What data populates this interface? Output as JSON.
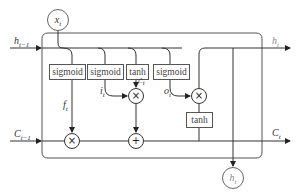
{
  "diagram": {
    "type": "LSTM cell",
    "inputs": {
      "x": {
        "base": "x",
        "sub": "t"
      },
      "h_prev": {
        "base": "h",
        "sub": "t−1"
      },
      "c_prev": {
        "base": "C",
        "sub": "t−1"
      }
    },
    "outputs": {
      "h_right": {
        "base": "h",
        "sub": "t"
      },
      "c_right": {
        "base": "C",
        "sub": "t"
      },
      "h_bottom": {
        "base": "h",
        "sub": "t"
      }
    },
    "gates": [
      {
        "id": "forget",
        "label": "sigmoid",
        "output": {
          "base": "f",
          "sub": "t"
        }
      },
      {
        "id": "input",
        "label": "sigmoid",
        "output": {
          "base": "i",
          "sub": "t"
        }
      },
      {
        "id": "candidate",
        "label": "tanh",
        "output": {
          "base": "C̃",
          "sub": "t"
        }
      },
      {
        "id": "output",
        "label": "sigmoid",
        "output": {
          "base": "o",
          "sub": "t"
        }
      }
    ],
    "cell_tanh": {
      "label": "tanh"
    },
    "operators": {
      "forget_mult": "×",
      "input_mult": "×",
      "cell_add": "+",
      "output_mult": "×"
    },
    "colors": {
      "line": "#333333",
      "box_border": "#555555",
      "output_label": "#888888"
    }
  }
}
